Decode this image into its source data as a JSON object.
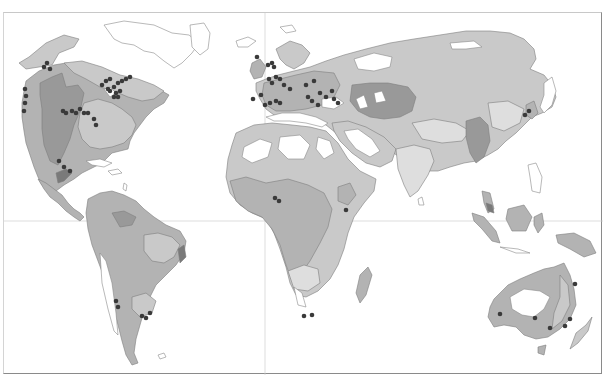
{
  "map": {
    "type": "world-thematic-map",
    "projection": "unlabeled world map with equator and prime meridian lines",
    "palette": {
      "background": "#ffffff",
      "zone_lightest": "#dedede",
      "zone_light": "#c9c9c9",
      "zone_medium": "#b3b3b3",
      "zone_dark": "#999999",
      "zone_darkest": "#7a7a7a",
      "unshaded_land": "#ffffff",
      "site_marker": "#3a3a3a",
      "coastline": "#7d7d7d",
      "grid_line": "#cfcfcf"
    },
    "legend": null,
    "title": null,
    "site_markers": {
      "description": "dark dots marking sites",
      "regions": [
        {
          "region": "Pacific Northwest North America",
          "count": 3
        },
        {
          "region": "California coast",
          "count": 4
        },
        {
          "region": "Great Lakes / Northeast USA",
          "count": 14
        },
        {
          "region": "Gulf Coast USA",
          "count": 7
        },
        {
          "region": "Florida",
          "count": 2
        },
        {
          "region": "Central America",
          "count": 3
        },
        {
          "region": "British Isles",
          "count": 1
        },
        {
          "region": "Low Countries / Western Europe",
          "count": 3
        },
        {
          "region": "France / Alps",
          "count": 5
        },
        {
          "region": "Iberia / Western Mediterranean",
          "count": 6
        },
        {
          "region": "Italy / Balkans / Black Sea",
          "count": 8
        },
        {
          "region": "Anatolia / Levant",
          "count": 3
        },
        {
          "region": "Japan / Korea",
          "count": 2
        },
        {
          "region": "West Africa (Gulf of Guinea)",
          "count": 2
        },
        {
          "region": "East Africa (Lake Victoria)",
          "count": 1
        },
        {
          "region": "Chile",
          "count": 2
        },
        {
          "region": "Rio de la Plata",
          "count": 3
        },
        {
          "region": "South Africa",
          "count": 2
        },
        {
          "region": "Western Australia",
          "count": 1
        },
        {
          "region": "South Australia",
          "count": 2
        },
        {
          "region": "Eastern Australia",
          "count": 3
        }
      ]
    }
  }
}
